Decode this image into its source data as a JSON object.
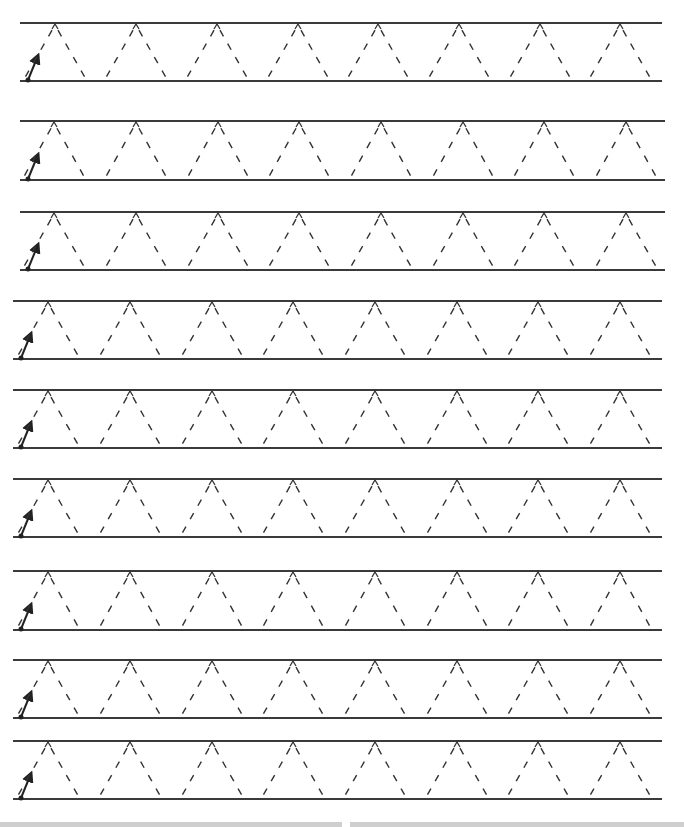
{
  "worksheet": {
    "title": "",
    "stroke_color": "#3a3a3a",
    "dash_color": "#333333",
    "rows": [
      {
        "top": 23,
        "base": 81,
        "left": 20,
        "right": 662,
        "apex_x": [
          55,
          136,
          217,
          298,
          378,
          459,
          540,
          620
        ]
      },
      {
        "top": 121,
        "base": 180,
        "left": 20,
        "right": 665,
        "apex_x": [
          54,
          136,
          218,
          299,
          381,
          463,
          544,
          626
        ]
      },
      {
        "top": 212,
        "base": 270,
        "left": 20,
        "right": 665,
        "apex_x": [
          54,
          136,
          218,
          299,
          381,
          463,
          544,
          626
        ]
      },
      {
        "top": 301,
        "base": 359,
        "left": 13,
        "right": 662,
        "apex_x": [
          48,
          130,
          212,
          293,
          375,
          457,
          538,
          620
        ]
      },
      {
        "top": 390,
        "base": 448,
        "left": 13,
        "right": 662,
        "apex_x": [
          48,
          130,
          212,
          293,
          375,
          457,
          538,
          620
        ]
      },
      {
        "top": 479,
        "base": 537,
        "left": 13,
        "right": 662,
        "apex_x": [
          48,
          130,
          212,
          293,
          375,
          457,
          538,
          620
        ]
      },
      {
        "top": 571,
        "base": 630,
        "left": 13,
        "right": 662,
        "apex_x": [
          48,
          130,
          212,
          293,
          375,
          457,
          538,
          620
        ]
      },
      {
        "top": 660,
        "base": 718,
        "left": 13,
        "right": 662,
        "apex_x": [
          48,
          130,
          212,
          293,
          375,
          457,
          538,
          620
        ]
      },
      {
        "top": 741,
        "base": 799,
        "left": 13,
        "right": 662,
        "apex_x": [
          48,
          130,
          212,
          293,
          375,
          457,
          538,
          620
        ]
      }
    ],
    "half_width": 32,
    "start_arrow": {
      "offset_x": 8,
      "length_dx": 9,
      "length_dy": 22
    }
  },
  "bottom_strip": [
    {
      "left": 0,
      "width": 342
    },
    {
      "left": 350,
      "width": 334
    }
  ]
}
